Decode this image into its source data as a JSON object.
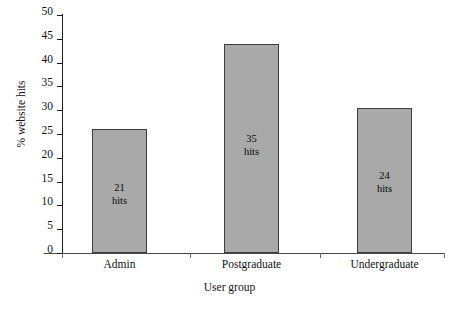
{
  "chart_data": {
    "type": "bar",
    "title": "",
    "subtitle": "",
    "categories": [
      "Admin",
      "Postgraduate",
      "Undergraduate"
    ],
    "values": [
      26,
      44,
      30.5
    ],
    "xlabel": "User group",
    "ylabel": "% website hits",
    "ylim": [
      0,
      50
    ],
    "yticks": [
      "0",
      "5",
      "10",
      "15",
      "20",
      "25",
      "30",
      "35",
      "40",
      "45",
      "50"
    ],
    "grid": false,
    "legend": false,
    "bar_color": "#a9a9a9",
    "bar_border_color": "#3d3d3d",
    "data_labels": [
      {
        "count": "21",
        "unit": "hits",
        "text": "21\nhits"
      },
      {
        "count": "35",
        "unit": "hits",
        "text": "35\nhits"
      },
      {
        "count": "24",
        "unit": "hits",
        "text": "24\nhits"
      }
    ]
  }
}
